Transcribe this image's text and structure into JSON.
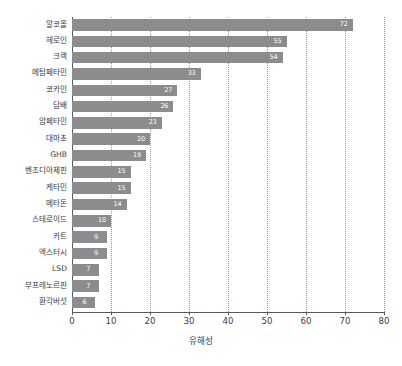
{
  "chart_data": {
    "type": "bar",
    "orientation": "horizontal",
    "title": "",
    "xlabel": "유해성",
    "ylabel": "",
    "xlim": [
      0,
      80
    ],
    "xticks": [
      0,
      10,
      20,
      30,
      40,
      50,
      60,
      70,
      80
    ],
    "grid": true,
    "grid_axis": "x",
    "legend": false,
    "bar_color": "#8c8c8e",
    "value_label_color": "#ffffff",
    "axis_color": "#58585a",
    "categories": [
      "알코올",
      "헤로인",
      "크랙",
      "메탐페타민",
      "코카인",
      "담배",
      "암페타민",
      "대마초",
      "GHB",
      "벤조디아제핀",
      "케타민",
      "메타돈",
      "스테로이드",
      "카트",
      "엑스터시",
      "LSD",
      "부프레노르핀",
      "환각버섯"
    ],
    "values": [
      72,
      55,
      54,
      33,
      27,
      26,
      23,
      20,
      19,
      15,
      15,
      14,
      10,
      9,
      9,
      7,
      7,
      6
    ]
  }
}
